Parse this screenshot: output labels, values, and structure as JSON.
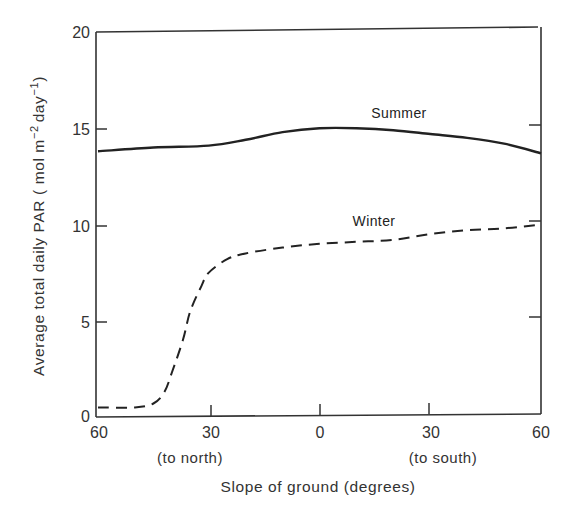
{
  "chart_data": {
    "type": "line",
    "title": "",
    "xlabel": "Slope of ground (degrees)",
    "ylabel": "Average total daily PAR ( mol m⁻² day⁻¹)",
    "xlim": [
      -60,
      60
    ],
    "ylim": [
      0,
      20
    ],
    "grid": false,
    "legend": "inline labels",
    "x_ticks": [
      {
        "value": -60,
        "label": "60"
      },
      {
        "value": -30,
        "label": "30"
      },
      {
        "value": 0,
        "label": "0"
      },
      {
        "value": 30,
        "label": "30"
      },
      {
        "value": 60,
        "label": "60"
      }
    ],
    "x_sublabels": [
      {
        "value": -30,
        "label": "(to north)"
      },
      {
        "value": 30,
        "label": "(to south)"
      }
    ],
    "y_ticks": [
      0,
      5,
      10,
      15,
      20
    ],
    "y_tick_labels": [
      "0",
      "5",
      "10",
      "15",
      "20"
    ],
    "series": [
      {
        "name": "Summer",
        "style": "solid",
        "x": [
          -60,
          -45,
          -30,
          -20,
          -10,
          0,
          10,
          20,
          30,
          40,
          50,
          60
        ],
        "values": [
          13.8,
          14.0,
          14.1,
          14.4,
          14.8,
          15.0,
          15.0,
          14.9,
          14.7,
          14.5,
          14.2,
          13.7
        ]
      },
      {
        "name": "Winter",
        "style": "dashed",
        "x": [
          -60,
          -50,
          -45,
          -42,
          -40,
          -37,
          -35,
          -32,
          -30,
          -25,
          -20,
          -10,
          0,
          10,
          20,
          30,
          40,
          50,
          60
        ],
        "values": [
          0.5,
          0.5,
          0.7,
          1.3,
          2.3,
          4.0,
          5.5,
          6.8,
          7.5,
          8.2,
          8.5,
          8.8,
          9.0,
          9.1,
          9.2,
          9.5,
          9.7,
          9.8,
          10.0
        ]
      }
    ],
    "annotations": [
      {
        "text": "Summer",
        "x": 25,
        "y": 15.8
      },
      {
        "text": "Winter",
        "x": 12,
        "y": 10.6
      }
    ]
  },
  "labels": {
    "x_axis_title": "Slope of ground (degrees)",
    "y_axis_title": "Average total daily PAR ( mol m",
    "y_axis_sup1": "−2",
    "y_axis_mid": "day",
    "y_axis_sup2": "−1",
    "y_axis_end": ")",
    "north": "(to north)",
    "south": "(to south)",
    "summer": "Summer",
    "winter": "Winter",
    "xt0": "60",
    "xt1": "30",
    "xt2": "0",
    "xt3": "30",
    "xt4": "60",
    "yt0": "0",
    "yt1": "5",
    "yt2": "10",
    "yt3": "15",
    "yt4": "20"
  }
}
